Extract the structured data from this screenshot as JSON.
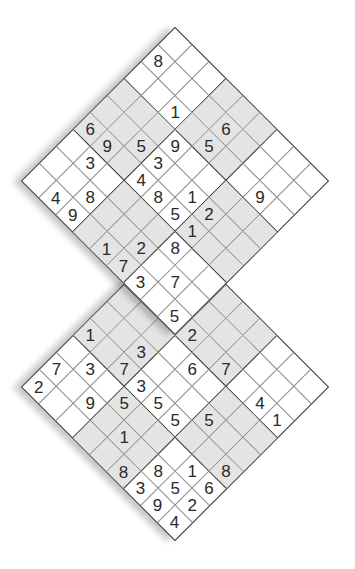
{
  "puzzle": {
    "type": "twin-overlapping-sudoku",
    "colors": {
      "shade": "#e4e4e4",
      "thick_line": "#333333",
      "thin_line": "#8a8a8a",
      "digit": "#2a2a2a"
    },
    "shaded_boxes": [
      [
        1,
        0
      ],
      [
        0,
        1
      ],
      [
        2,
        1
      ],
      [
        1,
        2
      ]
    ],
    "grids": [
      {
        "id": "upper",
        "rows": [
          ".........",
          "8...6....",
          "..1.5..9.",
          "...9.....",
          "..53.12..",
          "69.4851..",
          ".3....8..",
          "..8..2.7.",
          ".49.173.5"
        ]
      },
      {
        "id": "lower",
        "rows": [
          ".........",
          ".........",
          "...2.7.41",
          "....6....",
          "..3...5..",
          "1.7355..8",
          ".3.5...16",
          "7.9.1.852",
          "2....8394"
        ]
      }
    ]
  }
}
